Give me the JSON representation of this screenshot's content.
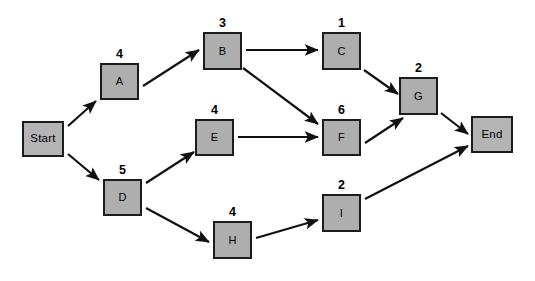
{
  "diagram": {
    "type": "activity-on-node network",
    "colors": {
      "node_fill": "#aeaeae",
      "terminal_fill": "#b4b4b4",
      "node_border": "#1c1c1c",
      "arrow": "#111111",
      "background": "#ffffff"
    },
    "nodes": [
      {
        "id": "start",
        "label": "Start",
        "duration": null,
        "x": 22,
        "y": 121,
        "w": 42,
        "h": 36,
        "terminal": true
      },
      {
        "id": "a",
        "label": "A",
        "duration": "4",
        "x": 100,
        "y": 63,
        "w": 39,
        "h": 37,
        "terminal": false
      },
      {
        "id": "b",
        "label": "B",
        "duration": "3",
        "x": 203,
        "y": 32,
        "w": 39,
        "h": 38,
        "terminal": false
      },
      {
        "id": "c",
        "label": "C",
        "duration": "1",
        "x": 322,
        "y": 32,
        "w": 39,
        "h": 38,
        "terminal": false
      },
      {
        "id": "d",
        "label": "D",
        "duration": "5",
        "x": 103,
        "y": 179,
        "w": 39,
        "h": 37,
        "terminal": false
      },
      {
        "id": "e",
        "label": "E",
        "duration": "4",
        "x": 195,
        "y": 119,
        "w": 39,
        "h": 37,
        "terminal": false
      },
      {
        "id": "f",
        "label": "F",
        "duration": "6",
        "x": 322,
        "y": 119,
        "w": 39,
        "h": 37,
        "terminal": false
      },
      {
        "id": "g",
        "label": "G",
        "duration": "2",
        "x": 399,
        "y": 77,
        "w": 39,
        "h": 38,
        "terminal": false
      },
      {
        "id": "h",
        "label": "H",
        "duration": "4",
        "x": 213,
        "y": 221,
        "w": 39,
        "h": 38,
        "terminal": false
      },
      {
        "id": "i",
        "label": "I",
        "duration": "2",
        "x": 322,
        "y": 194,
        "w": 39,
        "h": 38,
        "terminal": false
      },
      {
        "id": "end",
        "label": "End",
        "duration": null,
        "x": 471,
        "y": 116,
        "w": 42,
        "h": 37,
        "terminal": true
      }
    ],
    "edges": [
      {
        "id": "start-a",
        "from": "Start",
        "to": "A",
        "x1": 68,
        "y1": 126,
        "x2": 96,
        "y2": 101
      },
      {
        "id": "start-d",
        "from": "Start",
        "to": "D",
        "x1": 68,
        "y1": 154,
        "x2": 99,
        "y2": 180
      },
      {
        "id": "a-b",
        "from": "A",
        "to": "B",
        "x1": 143,
        "y1": 86,
        "x2": 199,
        "y2": 50
      },
      {
        "id": "b-c",
        "from": "B",
        "to": "C",
        "x1": 246,
        "y1": 50,
        "x2": 318,
        "y2": 50
      },
      {
        "id": "b-f",
        "from": "B",
        "to": "F",
        "x1": 243,
        "y1": 68,
        "x2": 318,
        "y2": 124
      },
      {
        "id": "c-g",
        "from": "C",
        "to": "G",
        "x1": 364,
        "y1": 70,
        "x2": 398,
        "y2": 94
      },
      {
        "id": "d-e",
        "from": "D",
        "to": "E",
        "x1": 146,
        "y1": 183,
        "x2": 194,
        "y2": 152
      },
      {
        "id": "d-h",
        "from": "D",
        "to": "H",
        "x1": 146,
        "y1": 208,
        "x2": 209,
        "y2": 242
      },
      {
        "id": "e-f",
        "from": "E",
        "to": "F",
        "x1": 238,
        "y1": 137,
        "x2": 318,
        "y2": 137
      },
      {
        "id": "f-g",
        "from": "F",
        "to": "G",
        "x1": 365,
        "y1": 143,
        "x2": 403,
        "y2": 118
      },
      {
        "id": "g-end",
        "from": "G",
        "to": "End",
        "x1": 441,
        "y1": 113,
        "x2": 468,
        "y2": 134
      },
      {
        "id": "h-i",
        "from": "H",
        "to": "I",
        "x1": 256,
        "y1": 238,
        "x2": 318,
        "y2": 220
      },
      {
        "id": "i-end",
        "from": "I",
        "to": "End",
        "x1": 365,
        "y1": 199,
        "x2": 468,
        "y2": 146
      }
    ]
  }
}
